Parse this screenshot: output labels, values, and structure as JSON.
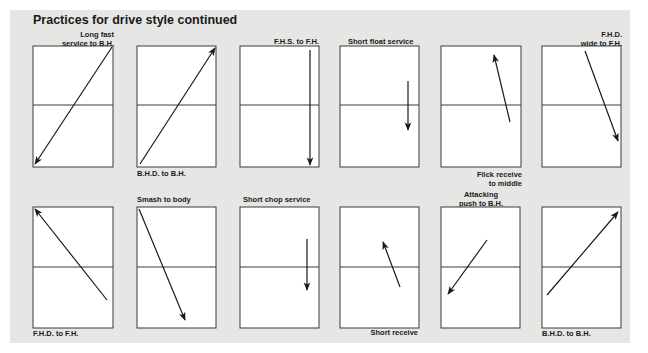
{
  "title": "Practices for drive style continued",
  "courts": [
    {
      "id": "c1",
      "label": "Long fast\nservice to B.H.",
      "label_pos": "top-right"
    },
    {
      "id": "c2",
      "label": "B.H.D. to B.H.",
      "label_pos": "bottom-left"
    },
    {
      "id": "c3",
      "label": "F.H.S. to F.H.",
      "label_pos": "top-right"
    },
    {
      "id": "c4",
      "label": "Short float service",
      "label_pos": "top-left"
    },
    {
      "id": "c5",
      "label": "Flick receive\nto middle",
      "label_pos": "bottom-right"
    },
    {
      "id": "c6",
      "label": "F.H.D.\nwide to F.H.",
      "label_pos": "top-right"
    },
    {
      "id": "c7",
      "label": "F.H.D. to F.H.",
      "label_pos": "bottom-left"
    },
    {
      "id": "c8",
      "label": "Smash to body",
      "label_pos": "top-left"
    },
    {
      "id": "c9",
      "label": "Short chop service",
      "label_pos": "top-left"
    },
    {
      "id": "c10",
      "label": "Short receive",
      "label_pos": "bottom-right"
    },
    {
      "id": "c11",
      "label": "Attacking\npush to B.H.",
      "label_pos": "top-center"
    },
    {
      "id": "c12",
      "label": "B.H.D. to B.H.",
      "label_pos": "bottom-left"
    }
  ],
  "labels": {
    "c1a": "Long fast",
    "c1b": "service to B.H.",
    "c2": "B.H.D. to B.H.",
    "c3": "F.H.S. to F.H.",
    "c4": "Short float service",
    "c5a": "Flick receive",
    "c5b": "to middle",
    "c6a": "F.H.D.",
    "c6b": "wide to F.H.",
    "c7": "F.H.D. to F.H.",
    "c8": "Smash to body",
    "c9": "Short chop service",
    "c10": "Short receive",
    "c11a": "Attacking",
    "c11b": "push to B.H.",
    "c12": "B.H.D. to B.H."
  }
}
